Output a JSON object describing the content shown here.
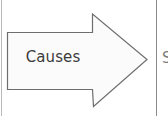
{
  "diagram": {
    "type": "flow-arrow",
    "shape": "right-pointing-block-arrow",
    "label": "Causes",
    "outline_color": "#6e6e6e",
    "fill_color": "#fbfbfb",
    "label_color": "#3b3b3b",
    "background_color": "#ffffff",
    "divider_color": "#8a8a8a"
  },
  "neighbor": {
    "clipped_text": "S"
  },
  "icons": {
    "arrow": "right-arrow-icon",
    "left_rule": "vertical-divider-icon",
    "right_rule": "vertical-divider-icon"
  }
}
